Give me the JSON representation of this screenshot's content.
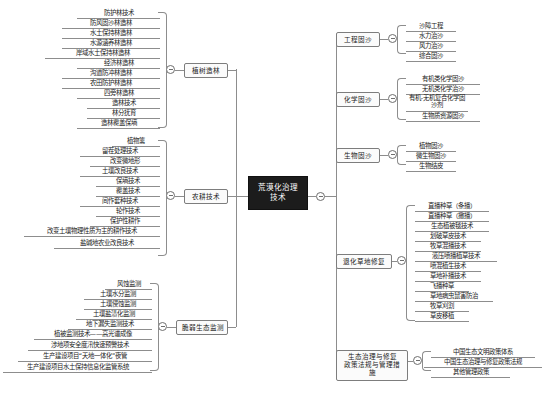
{
  "title": "荒漠化治理技术",
  "center": {
    "label": "荒漠化治理技术"
  },
  "left": {
    "branches": [
      {
        "label": "植树造林",
        "leaves": [
          "防护林技术",
          "防风固沙林造林",
          "水土保持林造林",
          "水源涵养林造林",
          "岸域水土保持林造林",
          "经济林造林",
          "沟道防冲林造林",
          "农田防护林造林",
          "四旁林造林",
          "造林技术",
          "林分抚育",
          "造林覆盖保墒"
        ]
      },
      {
        "label": "农耕技术",
        "leaves": [
          "植物篱",
          "留茬处理技术",
          "改变微地形",
          "土壤改良技术",
          "保墒技术",
          "覆盖技术",
          "间作套种技术",
          "轮作技术",
          "保护性耕作",
          "改变土壤物理性质为主的耕作技术",
          "盐碱地农业改良技术"
        ]
      },
      {
        "label": "脆弱生态监测",
        "leaves": [
          "风蚀监测",
          "土壤水分监测",
          "土壤侵蚀监测",
          "土壤盐渍化监测",
          "地下漏失监测技术",
          "植被监测技术——高光谱成像",
          "涉地项安全度汛快速预警技术",
          "生产建设项目“天地一体化”夜管",
          "生产建设项目水土保持信息化监管系统"
        ]
      }
    ]
  },
  "right": {
    "branches": [
      {
        "label": "工程固沙",
        "leaves": [
          "沙障工程",
          "水力治沙",
          "风力治沙",
          "综合固沙"
        ]
      },
      {
        "label": "化学固沙",
        "leaves": [
          "有机类化学固沙",
          "无机类化学治沙",
          "有机-无机复合化学固沙剂",
          "生物质资源固沙"
        ]
      },
      {
        "label": "生物固沙",
        "leaves": [
          "植物固沙",
          "微生物固沙",
          "生物结皮"
        ]
      },
      {
        "label": "退化草地修复",
        "leaves": [
          "直播种草（条播）",
          "直播种草（撒播）",
          "生态植被毯技术",
          "划破草皮技术",
          "牧草混播技术",
          "液压喷播植草技术",
          "喷混植生技术",
          "草地补播技术",
          "飞播种草",
          "草地病虫鼠害防治",
          "牧草刈割",
          "草皮移植"
        ]
      },
      {
        "label": "生态治理与修复\n政策法规与管理措施",
        "label_line1": "生态治理与修复",
        "label_line2": "政策法规与管理措施",
        "leaves": [
          "中国生态文明政策体系",
          "中国生态治理与修复政策法规",
          "其他管理政策"
        ]
      }
    ]
  },
  "colors": {
    "center_bg": "#1c1c1c",
    "center_text": "#ffffff",
    "line": "#8d8d8d",
    "text": "#1a1a1a"
  }
}
